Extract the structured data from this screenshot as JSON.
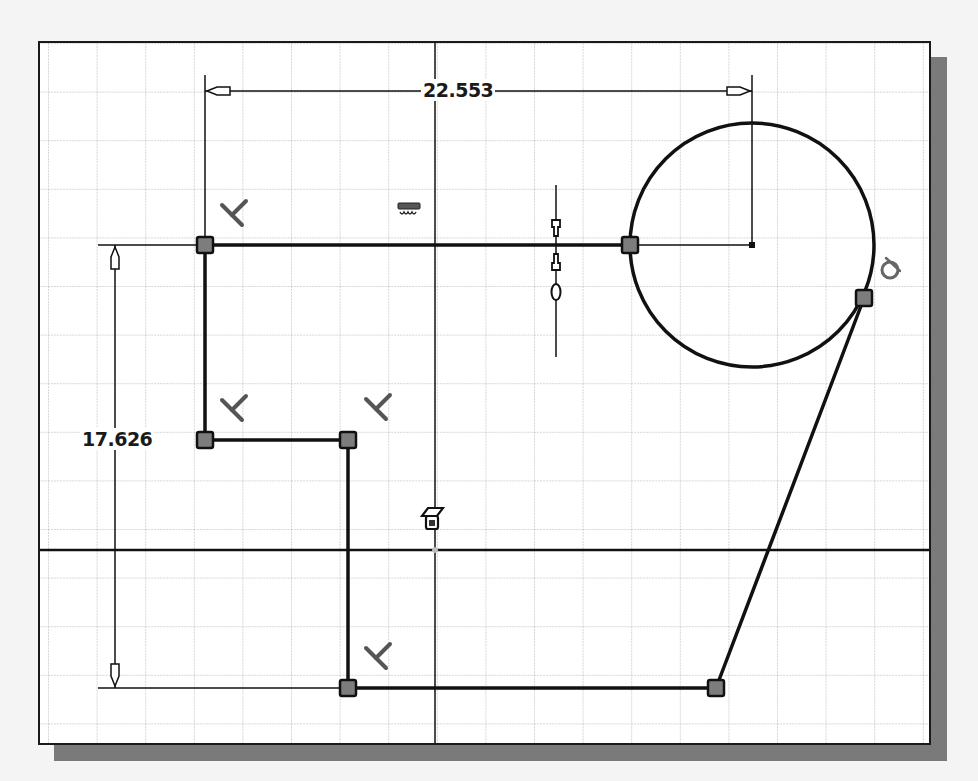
{
  "sketch": {
    "grid_spacing_px": 48.6,
    "colors": {
      "background": "#ffffff",
      "grid": "#c8c8c8",
      "geometry": "#111111",
      "point_fill": "#7d7d7d",
      "constraint_icon": "#8a8a8a",
      "shadow": "#7a7a7a"
    },
    "dimensions": [
      {
        "id": "horizontal",
        "value": "22.553",
        "orientation": "horizontal"
      },
      {
        "id": "vertical",
        "value": "17.626",
        "orientation": "vertical"
      }
    ],
    "constraints": [
      {
        "type": "perpendicular",
        "count": 4
      },
      {
        "type": "horizontal",
        "count": 1
      },
      {
        "type": "vertical-align",
        "count": 1
      },
      {
        "type": "tangent",
        "count": 1
      },
      {
        "type": "fix",
        "count": 1
      }
    ],
    "geometry": {
      "lines": [
        {
          "from": [
            203,
            243
          ],
          "to": [
            628,
            243
          ]
        },
        {
          "from": [
            203,
            243
          ],
          "to": [
            203,
            438
          ]
        },
        {
          "from": [
            203,
            438
          ],
          "to": [
            346,
            438
          ]
        },
        {
          "from": [
            346,
            438
          ],
          "to": [
            346,
            686
          ]
        },
        {
          "from": [
            346,
            686
          ],
          "to": [
            714,
            686
          ]
        },
        {
          "from": [
            714,
            686
          ],
          "to": [
            862,
            296
          ]
        }
      ],
      "circle": {
        "center": [
          750,
          243
        ],
        "radius": 122
      },
      "points": [
        [
          203,
          243
        ],
        [
          628,
          243
        ],
        [
          203,
          438
        ],
        [
          346,
          438
        ],
        [
          346,
          686
        ],
        [
          714,
          686
        ],
        [
          862,
          296
        ]
      ]
    }
  }
}
